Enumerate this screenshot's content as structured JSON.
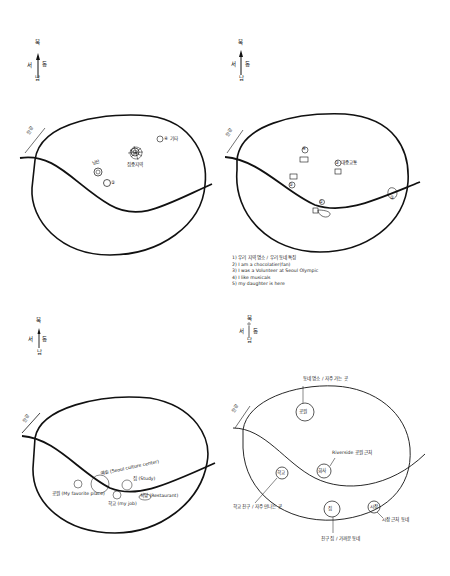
{
  "page": {
    "kind": "scanned sketch-map worksheet",
    "background": "#ffffff",
    "ink": "#111111"
  },
  "compass": {
    "north": "북",
    "south": "남",
    "west": "서",
    "east": "동"
  },
  "river_label": "한강",
  "maps": [
    {
      "id": "map-1",
      "labels": [
        {
          "text": "①",
          "ref": "landmark-cluster"
        },
        {
          "text": "남산",
          "ref": "left-site"
        },
        {
          "text": "②",
          "ref": "circle"
        },
        {
          "text": "④ 기타",
          "ref": "upper-right-site"
        },
        {
          "text": "집중지역",
          "ref": "center-cluster"
        }
      ]
    },
    {
      "id": "map-2",
      "labels": [
        {
          "text": "④",
          "ref": "top-marker"
        },
        {
          "text": "③ 대중교통",
          "ref": "right-marker"
        },
        {
          "text": "⑤",
          "ref": "left-marker"
        },
        {
          "text": "①",
          "ref": "river-marker"
        },
        {
          "text": "②",
          "ref": "east-marker"
        }
      ],
      "notes": [
        "1) 우리 지역 명소 / 우리 동네 특징",
        "2) I am a chocolatier(fan)",
        "3) I was a Volunteer at Seoul Olympic",
        "4) I like musicals",
        "5) my daughter is here"
      ]
    },
    {
      "id": "map-3",
      "labels": [
        {
          "text": "예술 (Seoul culture center)",
          "ref": "culture-center"
        },
        {
          "text": "집 (Study)",
          "ref": "study"
        },
        {
          "text": "공원 (My favorite place)",
          "ref": "favorite-place"
        },
        {
          "text": "학교 (my job)",
          "ref": "my-job"
        },
        {
          "text": "식당 (Restaurant)",
          "ref": "restaurant"
        }
      ]
    },
    {
      "id": "map-4",
      "labels": [
        {
          "text": "동네 명소 / 자주 가는 곳",
          "ref": "north-callout"
        },
        {
          "text": "공원",
          "ref": "north-circle"
        },
        {
          "text": "Riverside 공원 근처",
          "ref": "center-callout"
        },
        {
          "text": "회사",
          "ref": "center-circle"
        },
        {
          "text": "학교",
          "ref": "west-circle"
        },
        {
          "text": "학교 친구 / 자주 만나는 곳",
          "ref": "west-callout"
        },
        {
          "text": "집",
          "ref": "south-circle"
        },
        {
          "text": "친구 집 / 가까운 동네",
          "ref": "south-callout"
        },
        {
          "text": "시장",
          "ref": "southeast-circle"
        },
        {
          "text": "시장 근처 동네",
          "ref": "southeast-callout"
        }
      ]
    }
  ]
}
